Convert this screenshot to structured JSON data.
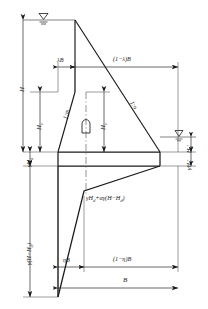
{
  "diagram": {
    "colors": {
      "line": "#1a1a1a",
      "thin": "#4a4a4a",
      "background": "#ffffff"
    },
    "labels": {
      "H": "H",
      "Hs": "H",
      "Hs_sub": "s",
      "Hs_inner": "H",
      "Hs_inner_sub": "s",
      "gamma_Hd": "γH",
      "gamma_Hd_sub": "d",
      "gamma_H_minus_Hd": "γ(H−H",
      "gamma_H_minus_Hd_sub": "d",
      "gamma_H_minus_Hd_end": ")",
      "lambda_B": "λB",
      "one_minus_lambda_B": "(1−λ)B",
      "eta_B": "ηB",
      "one_minus_eta_B": "(1−η)B",
      "B": "B",
      "slope_left": "1:m",
      "slope_right": "1:n",
      "pressure_expr": "γH",
      "pressure_expr_sub1": "d",
      "pressure_expr_mid": "+αγ(H−H",
      "pressure_expr_sub2": "d",
      "pressure_expr_end": ")",
      "gamma_Hd_prime": "γH",
      "gamma_Hd_prime_sub": "d",
      "gamma_Hd_prime_mark": "′",
      "Hd_prime": "H",
      "Hd_prime_sub": "d",
      "Hd_prime_mark": "′"
    },
    "icons": {
      "water_surface_upstream": "water-level-triangle-icon",
      "water_surface_downstream": "water-level-triangle-icon",
      "gallery": "drainage-gallery-icon"
    }
  }
}
